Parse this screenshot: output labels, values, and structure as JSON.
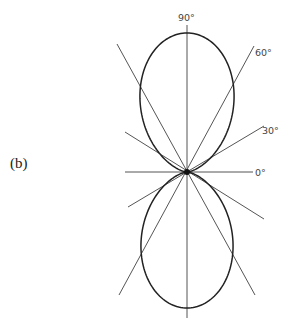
{
  "figure": {
    "label": "(b)",
    "center": {
      "x": 187,
      "y": 172
    },
    "pattern": {
      "type": "sin-squared",
      "top_radius": 139,
      "bottom_radius": 136,
      "x_scale": 0.88
    },
    "angle_lines": [
      {
        "angle_deg": 0,
        "label": "0°"
      },
      {
        "angle_deg": 30,
        "label": "30°"
      },
      {
        "angle_deg": 60,
        "label": "60°"
      },
      {
        "angle_deg": 90,
        "label": "90°"
      },
      {
        "angle_deg": 120,
        "label": ""
      },
      {
        "angle_deg": 150,
        "label": ""
      }
    ],
    "labels": {
      "deg90": "90°",
      "deg60": "60°",
      "deg30": "30°",
      "deg0": "0°"
    },
    "colors": {
      "line": "#555555",
      "curve": "#222222"
    }
  }
}
